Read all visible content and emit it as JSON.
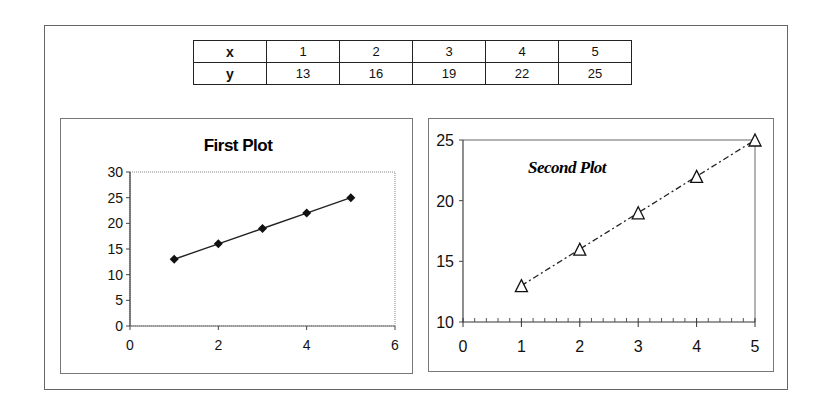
{
  "table": {
    "rows": [
      {
        "label": "x",
        "values": [
          "1",
          "2",
          "3",
          "4",
          "5"
        ]
      },
      {
        "label": "y",
        "values": [
          "13",
          "16",
          "19",
          "22",
          "25"
        ]
      }
    ]
  },
  "chart_data": [
    {
      "type": "line",
      "title": "First Plot",
      "x": [
        1,
        2,
        3,
        4,
        5
      ],
      "series": [
        {
          "name": "y",
          "values": [
            13,
            16,
            19,
            22,
            25
          ],
          "marker": "diamond-filled",
          "line": "solid",
          "color": "#111111"
        }
      ],
      "xlabel": "",
      "ylabel": "",
      "xlim": [
        0,
        6
      ],
      "ylim": [
        0,
        30
      ],
      "xticks": [
        "0",
        "2",
        "4",
        "6"
      ],
      "yticks": [
        "0",
        "5",
        "10",
        "15",
        "20",
        "25",
        "30"
      ],
      "grid": false,
      "legend": false,
      "title_position": "top-center"
    },
    {
      "type": "line",
      "title": "Second Plot",
      "x": [
        1,
        2,
        3,
        4,
        5
      ],
      "series": [
        {
          "name": "y",
          "values": [
            13,
            16,
            19,
            22,
            25
          ],
          "marker": "triangle-open",
          "line": "dash-dot",
          "color": "#111111"
        }
      ],
      "xlabel": "",
      "ylabel": "",
      "xlim": [
        0,
        5
      ],
      "ylim": [
        10,
        25
      ],
      "xticks": [
        "0",
        "1",
        "2",
        "3",
        "4",
        "5"
      ],
      "yticks": [
        "10",
        "15",
        "20",
        "25"
      ],
      "minor_xticks_per_unit": 5,
      "grid": false,
      "legend": false,
      "title_position": "inside-top-left"
    }
  ]
}
